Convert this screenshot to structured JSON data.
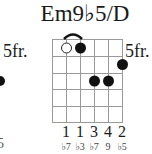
{
  "chord": {
    "name": "Em9♭5/D",
    "start_fret_label": "5fr.",
    "strings": 6,
    "frets_shown": 5,
    "barre": {
      "from_string": 2,
      "to_string": 3,
      "fret": 1
    },
    "dots": [
      {
        "string": 2,
        "fret": 1,
        "type": "open"
      },
      {
        "string": 3,
        "fret": 1,
        "type": "filled"
      },
      {
        "string": 6,
        "fret": 2,
        "type": "filled"
      },
      {
        "string": 4,
        "fret": 3,
        "type": "filled"
      },
      {
        "string": 5,
        "fret": 3,
        "type": "filled"
      }
    ],
    "fingers": [
      {
        "string": 2,
        "label": "1"
      },
      {
        "string": 3,
        "label": "1"
      },
      {
        "string": 4,
        "label": "3"
      },
      {
        "string": 5,
        "label": "4"
      },
      {
        "string": 6,
        "label": "2"
      }
    ],
    "intervals": [
      {
        "string": 2,
        "label": "♭7"
      },
      {
        "string": 3,
        "label": "♭3"
      },
      {
        "string": 4,
        "label": "♭7"
      },
      {
        "string": 5,
        "label": "9"
      },
      {
        "string": 6,
        "label": "♭5"
      }
    ]
  },
  "previous_chord_fragment": {
    "start_fret_label": "5fr.",
    "partial_label": "5"
  }
}
